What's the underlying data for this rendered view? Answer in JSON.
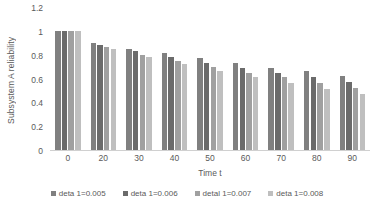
{
  "chart_data": {
    "type": "bar",
    "title": "",
    "xlabel": "Time t",
    "ylabel": "Subsystem A reliability",
    "categories": [
      "0",
      "20",
      "30",
      "40",
      "50",
      "60",
      "70",
      "80",
      "90"
    ],
    "ylim": [
      0,
      1.2
    ],
    "yticks": [
      "0",
      "0.2",
      "0.4",
      "0.6",
      "0.8",
      "1",
      "1.2"
    ],
    "ytick_values": [
      0,
      0.2,
      0.4,
      0.6,
      0.8,
      1,
      1.2
    ],
    "grid": false,
    "legend_position": "bottom",
    "series": [
      {
        "name": "deta 1=0.005",
        "color": "#808080",
        "values": [
          1.0,
          0.9,
          0.85,
          0.81,
          0.77,
          0.73,
          0.69,
          0.66,
          0.62
        ]
      },
      {
        "name": "deta 1=0.006",
        "color": "#6b6b6b",
        "values": [
          1.0,
          0.88,
          0.83,
          0.78,
          0.73,
          0.69,
          0.65,
          0.61,
          0.57
        ]
      },
      {
        "name": "detal 1=0.007",
        "color": "#a0a0a0",
        "values": [
          1.0,
          0.865,
          0.8,
          0.75,
          0.7,
          0.65,
          0.61,
          0.56,
          0.52
        ]
      },
      {
        "name": "deta 1=0.008",
        "color": "#bfbfbf",
        "values": [
          1.0,
          0.85,
          0.78,
          0.72,
          0.66,
          0.61,
          0.565,
          0.51,
          0.47
        ]
      }
    ]
  }
}
